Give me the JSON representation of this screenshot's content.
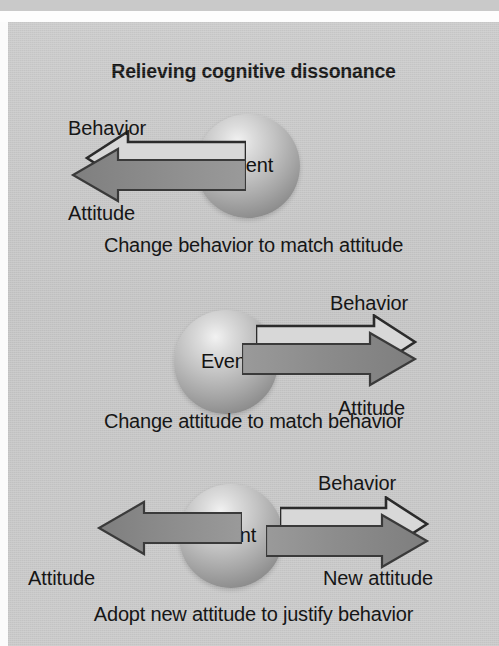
{
  "figure": {
    "title": "Relieving cognitive dissonance",
    "node_label": "Event",
    "background_color": "#c7c7c7",
    "arrow_dark_color": "#8c8c8c",
    "arrow_light_color": "#d6d6d6",
    "outline_color": "#2c2c2c",
    "text_color": "#161616"
  },
  "diagrams": [
    {
      "id": "change-behavior",
      "node": "Event",
      "caption": "Change behavior to match attitude",
      "arrows": [
        {
          "id": "behavior-left-outline",
          "label": "Behavior",
          "direction": "left",
          "style": "outline",
          "label_position": "above-left"
        },
        {
          "id": "attitude-left-solid",
          "label": "Attitude",
          "direction": "left",
          "style": "solid",
          "label_position": "below-left"
        }
      ]
    },
    {
      "id": "change-attitude",
      "node": "Event",
      "caption": "Change attitude to match behavior",
      "arrows": [
        {
          "id": "behavior-right-outline",
          "label": "Behavior",
          "direction": "right",
          "style": "outline",
          "label_position": "above-right"
        },
        {
          "id": "attitude-right-solid",
          "label": "Attitude",
          "direction": "right",
          "style": "solid",
          "label_position": "below-right"
        }
      ]
    },
    {
      "id": "adopt-new-attitude",
      "node": "Event",
      "caption": "Adopt new attitude to justify behavior",
      "arrows": [
        {
          "id": "attitude-left-solid-3",
          "label": "Attitude",
          "direction": "left",
          "style": "solid",
          "label_position": "below-left"
        },
        {
          "id": "behavior-right-outline-3",
          "label": "Behavior",
          "direction": "right",
          "style": "outline",
          "label_position": "above-right"
        },
        {
          "id": "new-attitude-right-solid-3",
          "label": "New attitude",
          "direction": "right",
          "style": "solid",
          "label_position": "below-right"
        }
      ]
    }
  ],
  "labels": {
    "d1_behavior": "Behavior",
    "d1_attitude": "Attitude",
    "d1_event": "Event",
    "d1_caption": "Change behavior to match attitude",
    "d2_behavior": "Behavior",
    "d2_attitude": "Attitude",
    "d2_event": "Event",
    "d2_caption": "Change attitude to match behavior",
    "d3_behavior": "Behavior",
    "d3_attitude": "Attitude",
    "d3_new_attitude": "New attitude",
    "d3_event": "Event",
    "d3_caption": "Adopt new attitude to justify behavior"
  }
}
